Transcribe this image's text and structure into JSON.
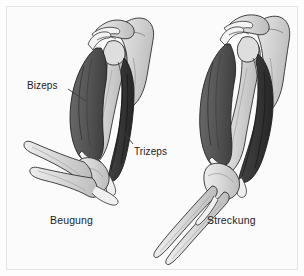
{
  "figure": {
    "background_color": "#fbfbfb",
    "frame_color": "#e4e4e4",
    "text_color": "#1c1c1c"
  },
  "labels": {
    "bizeps": "Bizeps",
    "trizeps": "Trizeps"
  },
  "captions": {
    "left": "Beugung",
    "right": "Streckung"
  },
  "palette": {
    "bone_light": "#dcdcdc",
    "bone_mid": "#c9c9c9",
    "bone_shadow": "#b4b4b4",
    "muscle_biceps": "#5d5d5d",
    "muscle_biceps_shade": "#4a4a4a",
    "muscle_triceps": "#3a3a3a",
    "muscle_triceps_shade": "#2e2e2e",
    "outline": "#2a2a2a",
    "tendon": "#f2f2f2",
    "leader_line": "#3a3a3a"
  },
  "panels": [
    {
      "name": "flexion",
      "caption": "Beugung",
      "description": "Linker Arm, Ellbogen gebeugt, Bizeps kontrahiert",
      "muscles": [
        "Bizeps",
        "Trizeps"
      ],
      "bones": [
        "Skapula",
        "Humerus",
        "Radius",
        "Ulna"
      ]
    },
    {
      "name": "extension",
      "caption": "Streckung",
      "description": "Rechter Arm, Ellbogen gestreckt, Trizeps kontrahiert",
      "muscles": [
        "Bizeps",
        "Trizeps"
      ],
      "bones": [
        "Skapula",
        "Humerus",
        "Radius",
        "Ulna"
      ]
    }
  ],
  "icons": {
    "leader_bizeps": "leader-line-icon",
    "leader_trizeps": "leader-line-icon"
  }
}
